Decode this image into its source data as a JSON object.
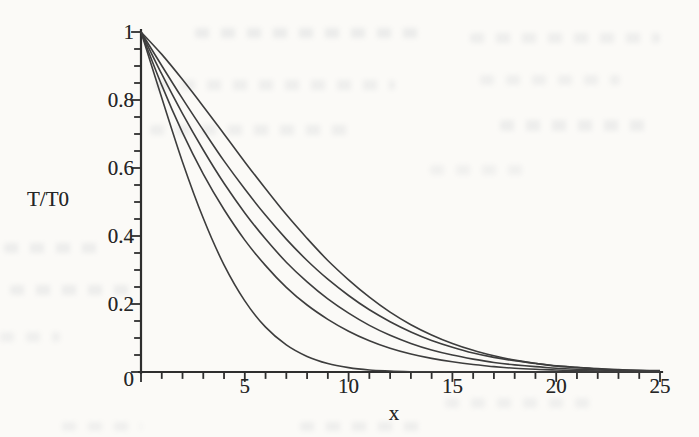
{
  "chart_data": {
    "type": "line",
    "title": "",
    "xlabel": "x",
    "ylabel": "T/T0",
    "xlim": [
      0,
      25
    ],
    "ylim": [
      0,
      1
    ],
    "grid": false,
    "legend": "none",
    "axis_color": "#2e2e2e",
    "line_color": "#3d3d3d",
    "origin_label": "0",
    "x_tick_labels": [
      "5",
      "10",
      "15",
      "20",
      "25"
    ],
    "x_major_tick_step": 5,
    "x_minor_tick_step": 1,
    "y_tick_labels": [
      "1",
      "0.8",
      "0.6",
      "0.4",
      "0.2",
      "0"
    ],
    "y_major_tick_step": 0.2,
    "y_minor_tick_step": 0.05,
    "x": [
      0,
      1,
      2,
      3,
      4,
      5,
      6,
      7,
      8,
      9,
      10,
      11,
      12,
      13,
      14,
      15,
      16,
      17,
      18,
      19,
      20,
      21,
      22,
      23,
      24,
      25
    ],
    "series": [
      {
        "name": "curve-1",
        "position": "leftmost-steepest",
        "values": [
          1,
          0.806,
          0.618,
          0.452,
          0.315,
          0.209,
          0.132,
          0.08,
          0.046,
          0.025,
          0.013,
          0.006,
          0.003,
          0.001,
          0.001,
          0,
          0,
          0,
          0,
          0,
          0,
          0,
          0,
          0,
          0,
          0
        ]
      },
      {
        "name": "curve-2",
        "position": "second-from-left",
        "values": [
          1,
          0.843,
          0.704,
          0.582,
          0.478,
          0.388,
          0.313,
          0.249,
          0.197,
          0.155,
          0.12,
          0.092,
          0.07,
          0.053,
          0.04,
          0.03,
          0.022,
          0.016,
          0.011,
          0.008,
          0.006,
          0.004,
          0.003,
          0.002,
          0.001,
          0.001
        ]
      },
      {
        "name": "curve-3",
        "position": "middle",
        "values": [
          1,
          0.876,
          0.76,
          0.653,
          0.555,
          0.468,
          0.391,
          0.323,
          0.265,
          0.215,
          0.173,
          0.137,
          0.108,
          0.084,
          0.065,
          0.05,
          0.038,
          0.028,
          0.021,
          0.016,
          0.011,
          0.008,
          0.006,
          0.004,
          0.003,
          0.002
        ]
      },
      {
        "name": "curve-4",
        "position": "second-from-right",
        "values": [
          1,
          0.901,
          0.804,
          0.711,
          0.621,
          0.538,
          0.461,
          0.391,
          0.328,
          0.273,
          0.225,
          0.183,
          0.148,
          0.118,
          0.093,
          0.073,
          0.056,
          0.043,
          0.033,
          0.025,
          0.018,
          0.014,
          0.01,
          0.007,
          0.005,
          0.004
        ]
      },
      {
        "name": "curve-5",
        "position": "rightmost-shallowest",
        "values": [
          1,
          0.934,
          0.86,
          0.781,
          0.7,
          0.618,
          0.539,
          0.463,
          0.393,
          0.328,
          0.271,
          0.22,
          0.176,
          0.139,
          0.109,
          0.084,
          0.064,
          0.048,
          0.035,
          0.026,
          0.018,
          0.013,
          0.009,
          0.006,
          0.004,
          0.003
        ]
      }
    ]
  }
}
